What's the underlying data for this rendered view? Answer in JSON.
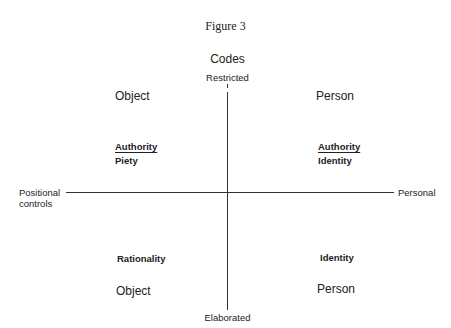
{
  "figure": {
    "title": "Figure 3",
    "heading": "Codes",
    "vertical_axis": {
      "top_label": "Restricted",
      "bottom_label": "Elaborated"
    },
    "horizontal_axis": {
      "left_label_line1": "Positional",
      "left_label_line2": "controls",
      "right_label": "Personal"
    },
    "quadrants": {
      "top_left": {
        "focus": "Object",
        "underlined": "Authority",
        "sub": "Piety"
      },
      "top_right": {
        "focus": "Person",
        "underlined": "Authority",
        "sub": "Identity"
      },
      "bottom_left": {
        "label": "Rationality",
        "focus": "Object"
      },
      "bottom_right": {
        "label": "Identity",
        "focus": "Person"
      }
    }
  }
}
